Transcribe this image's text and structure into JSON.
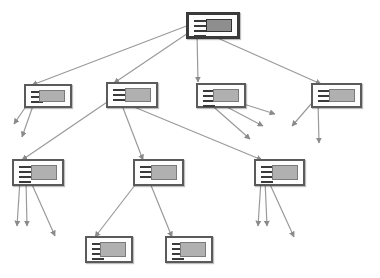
{
  "diagram": {
    "type": "tree",
    "colors": {
      "edge": "#9a9a9a",
      "node_border": "#5a5a5a",
      "thumbnail": "#b0b0b0",
      "root_thumbnail": "#8e8e8e"
    },
    "nodes": [
      {
        "id": "root",
        "x": 186,
        "y": 12,
        "w": 54,
        "h": 27,
        "lines": 4,
        "root": true
      },
      {
        "id": "n1",
        "x": 24,
        "y": 84,
        "w": 48,
        "h": 24,
        "lines": 3
      },
      {
        "id": "n2",
        "x": 106,
        "y": 82,
        "w": 52,
        "h": 26,
        "lines": 3
      },
      {
        "id": "n3",
        "x": 196,
        "y": 83,
        "w": 50,
        "h": 25,
        "lines": 4
      },
      {
        "id": "n4",
        "x": 311,
        "y": 83,
        "w": 51,
        "h": 25,
        "lines": 3
      },
      {
        "id": "n5",
        "x": 12,
        "y": 159,
        "w": 52,
        "h": 27,
        "lines": 4
      },
      {
        "id": "n6",
        "x": 133,
        "y": 159,
        "w": 51,
        "h": 27,
        "lines": 3
      },
      {
        "id": "n7",
        "x": 254,
        "y": 159,
        "w": 51,
        "h": 27,
        "lines": 4
      },
      {
        "id": "n8",
        "x": 85,
        "y": 236,
        "w": 48,
        "h": 27,
        "lines": 4
      },
      {
        "id": "n9",
        "x": 165,
        "y": 236,
        "w": 48,
        "h": 27,
        "lines": 4
      }
    ],
    "edges": [
      {
        "from": [
          197,
          22
        ],
        "to": [
          32,
          85
        ]
      },
      {
        "from": [
          197,
          27
        ],
        "to": [
          114,
          83
        ]
      },
      {
        "from": [
          197,
          32
        ],
        "to": [
          198,
          82
        ]
      },
      {
        "from": [
          204,
          32
        ],
        "to": [
          321,
          84
        ]
      },
      {
        "from": [
          33,
          96
        ],
        "to": [
          14,
          124
        ]
      },
      {
        "from": [
          35,
          100
        ],
        "to": [
          22,
          137
        ]
      },
      {
        "from": [
          116,
          96
        ],
        "to": [
          22,
          160
        ]
      },
      {
        "from": [
          120,
          100
        ],
        "to": [
          143,
          160
        ]
      },
      {
        "from": [
          122,
          102
        ],
        "to": [
          262,
          160
        ]
      },
      {
        "from": [
          206,
          92
        ],
        "to": [
          275,
          114
        ]
      },
      {
        "from": [
          206,
          96
        ],
        "to": [
          263,
          126
        ]
      },
      {
        "from": [
          208,
          102
        ],
        "to": [
          250,
          139
        ]
      },
      {
        "from": [
          318,
          96
        ],
        "to": [
          292,
          126
        ]
      },
      {
        "from": [
          318,
          100
        ],
        "to": [
          319,
          143
        ]
      },
      {
        "from": [
          20,
          180
        ],
        "to": [
          17,
          226
        ]
      },
      {
        "from": [
          26,
          180
        ],
        "to": [
          27,
          226
        ]
      },
      {
        "from": [
          30,
          180
        ],
        "to": [
          55,
          236
        ]
      },
      {
        "from": [
          142,
          176
        ],
        "to": [
          95,
          237
        ]
      },
      {
        "from": [
          148,
          178
        ],
        "to": [
          172,
          237
        ]
      },
      {
        "from": [
          261,
          180
        ],
        "to": [
          258,
          226
        ]
      },
      {
        "from": [
          265,
          180
        ],
        "to": [
          267,
          226
        ]
      },
      {
        "from": [
          268,
          180
        ],
        "to": [
          294,
          237
        ]
      }
    ]
  }
}
